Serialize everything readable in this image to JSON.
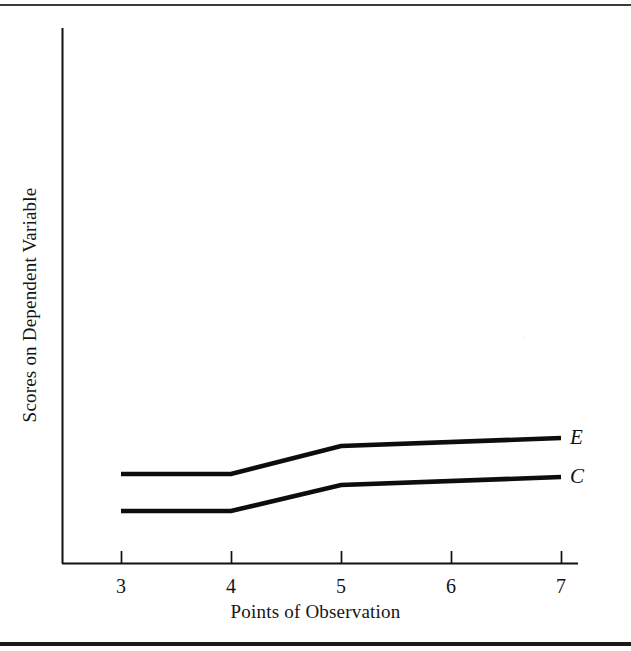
{
  "figure": {
    "y_axis_title": "Scores on Dependent Variable",
    "x_axis_title": "Points of Observation",
    "top_rule_label": "top-rule",
    "bottom_rule_label": "bottom-rule",
    "artifact_glyph": "·"
  },
  "chart_data": {
    "type": "line",
    "title": "",
    "subtitle": "",
    "xlabel": "Points of Observation",
    "ylabel": "Scores on Dependent Variable",
    "x": [
      3,
      4,
      5,
      7
    ],
    "tick_labels": [
      "3",
      "4",
      "5",
      "6",
      "7"
    ],
    "x_ticks": [
      3,
      4,
      5,
      6,
      7
    ],
    "xlim": [
      2.46,
      7.15
    ],
    "ylim": [
      0,
      100
    ],
    "grid": false,
    "legend": "inline-end-labels",
    "y_axis_ticks": [],
    "series": [
      {
        "name": "E",
        "label": "E",
        "color": "#0d0d0d",
        "x": [
          3,
          4,
          5,
          7
        ],
        "values": [
          16.6,
          16.6,
          21.9,
          23.4
        ]
      },
      {
        "name": "C",
        "label": "C",
        "color": "#0d0d0d",
        "x": [
          3,
          4,
          5,
          7
        ],
        "values": [
          9.7,
          9.7,
          14.6,
          16.1
        ]
      }
    ],
    "annotations": [
      {
        "text": "E",
        "x": 7.1,
        "y": 23.4
      },
      {
        "text": "C",
        "x": 7.1,
        "y": 16.1
      }
    ],
    "pixel_geometry": {
      "axis_origin": [
        62,
        563
      ],
      "x_axis_end": [
        578,
        563
      ],
      "y_axis_top": [
        62,
        28
      ],
      "tick_x_positions": [
        121,
        231,
        341,
        451,
        561
      ],
      "series_E_points": [
        [
          121,
          474
        ],
        [
          231,
          474
        ],
        [
          341,
          446
        ],
        [
          561,
          438
        ]
      ],
      "series_C_points": [
        [
          121,
          511
        ],
        [
          231,
          511
        ],
        [
          341,
          485
        ],
        [
          561,
          477
        ]
      ]
    }
  }
}
